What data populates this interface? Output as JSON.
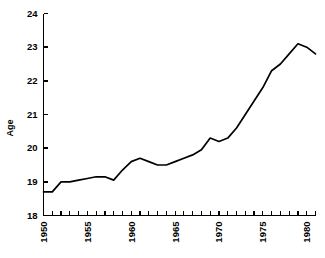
{
  "chart_data": {
    "type": "line",
    "title": "",
    "subtitle": "",
    "xlabel": "",
    "ylabel": "Age",
    "xlim": [
      1950,
      1981
    ],
    "ylim": [
      18,
      24
    ],
    "grid": false,
    "legend": false,
    "legend_position": "none",
    "line_color": "#000000",
    "background_color": "#ffffff",
    "x_tick_labels": [
      "1950",
      "1955",
      "1960",
      "1965",
      "1970",
      "1975",
      "1980"
    ],
    "x_tick_label_values": [
      1950,
      1955,
      1960,
      1965,
      1970,
      1975,
      1980
    ],
    "x_minor_tick_values": [
      1950,
      1951,
      1952,
      1953,
      1954,
      1955,
      1956,
      1957,
      1958,
      1959,
      1960,
      1961,
      1962,
      1963,
      1964,
      1965,
      1966,
      1967,
      1968,
      1969,
      1970,
      1971,
      1972,
      1973,
      1974,
      1975,
      1976,
      1977,
      1978,
      1979,
      1980,
      1981
    ],
    "x_tick_label_rotation": -90,
    "y_tick_labels": [
      "18",
      "19",
      "20",
      "21",
      "22",
      "23",
      "24"
    ],
    "y_tick_label_values": [
      18,
      19,
      20,
      21,
      22,
      23,
      24
    ],
    "x": [
      1950,
      1951,
      1952,
      1953,
      1954,
      1955,
      1956,
      1957,
      1958,
      1959,
      1960,
      1961,
      1962,
      1963,
      1964,
      1965,
      1966,
      1967,
      1968,
      1969,
      1970,
      1971,
      1972,
      1973,
      1974,
      1975,
      1976,
      1977,
      1978,
      1979,
      1980,
      1981
    ],
    "values": [
      18.7,
      18.7,
      19.0,
      19.0,
      19.05,
      19.1,
      19.15,
      19.15,
      19.05,
      19.35,
      19.6,
      19.7,
      19.6,
      19.5,
      19.5,
      19.6,
      19.7,
      19.8,
      19.95,
      20.3,
      20.2,
      20.3,
      20.6,
      21.0,
      21.4,
      21.8,
      22.3,
      22.5,
      22.8,
      23.1,
      23.0,
      22.8
    ],
    "series": [
      {
        "name": "Age",
        "values": [
          18.7,
          18.7,
          19.0,
          19.0,
          19.05,
          19.1,
          19.15,
          19.15,
          19.05,
          19.35,
          19.6,
          19.7,
          19.6,
          19.5,
          19.5,
          19.6,
          19.7,
          19.8,
          19.95,
          20.3,
          20.2,
          20.3,
          20.6,
          21.0,
          21.4,
          21.8,
          22.3,
          22.5,
          22.8,
          23.1,
          23.0,
          22.8
        ]
      }
    ]
  }
}
